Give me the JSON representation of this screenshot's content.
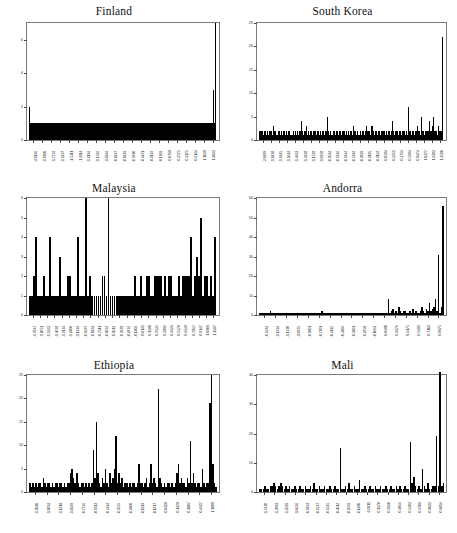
{
  "figure": {
    "title": "",
    "background": "#ffffff",
    "bar_color": "#000000",
    "axis_color": "#7a7a7a",
    "layout": "2 columns x 3 rows"
  },
  "chart_data": [
    {
      "type": "bar",
      "title": "Finland",
      "xlabel": "",
      "ylabel": "",
      "ylim": [
        0,
        7
      ],
      "yticks": [
        0,
        2,
        4,
        6
      ],
      "grid": false,
      "legend": null,
      "xticklabels": [
        "-2.0196",
        "-1.8700",
        "-1.7774",
        "-1.6237",
        "-1.5311",
        "-1.3114",
        "-1.2184",
        "-1.1746",
        "-1.0244",
        "-0.9247",
        "-0.8249",
        "-0.6990",
        "-0.4421",
        "-0.3124",
        "-0.1709",
        "0.0718",
        "0.2775",
        "0.4175",
        "0.6124",
        "1.1048",
        "1.3043"
      ],
      "values": [
        2.0,
        1.0,
        1.0,
        1.0,
        1.0,
        1.0,
        1.0,
        1.0,
        1.0,
        1.0,
        1.0,
        1.0,
        1.0,
        1.0,
        1.0,
        1.0,
        1.0,
        1.0,
        1.0,
        1.0,
        1.0,
        1.0,
        1.0,
        1.0,
        1.0,
        1.0,
        1.0,
        1.0,
        1.0,
        1.0,
        1.0,
        1.0,
        1.0,
        1.0,
        1.0,
        1.0,
        1.0,
        1.0,
        1.0,
        1.0,
        1.0,
        1.0,
        1.0,
        1.0,
        1.0,
        1.0,
        1.0,
        1.0,
        1.0,
        1.0,
        1.0,
        1.0,
        1.0,
        1.0,
        1.0,
        1.0,
        1.0,
        1.0,
        1.0,
        1.0,
        1.0,
        1.0,
        1.0,
        1.0,
        1.0,
        1.0,
        1.0,
        1.0,
        1.0,
        1.0,
        1.0,
        1.0,
        1.0,
        1.0,
        1.0,
        1.0,
        1.0,
        1.0,
        1.0,
        1.0,
        1.0,
        1.0,
        1.0,
        1.0,
        1.0,
        1.0,
        1.0,
        1.0,
        1.0,
        1.0,
        1.0,
        1.0,
        1.0,
        1.0,
        1.0,
        1.0,
        1.0,
        1.0,
        1.0,
        1.0,
        1.0,
        1.0,
        1.0,
        1.0,
        1.0,
        1.0,
        1.0,
        1.0,
        1.0,
        1.0,
        1.0,
        1.0,
        1.0,
        1.0,
        1.0,
        1.0,
        1.0,
        1.0,
        1.0,
        1.0,
        1.0,
        1.0,
        1.0,
        1.0,
        1.0,
        1.0,
        1.0,
        1.0,
        1.0,
        1.0,
        1.0,
        1.0,
        1.0,
        1.0,
        1.0,
        1.0,
        1.0,
        1.0,
        1.0,
        1.0,
        1.0,
        1.0,
        1.0,
        1.0,
        1.0,
        1.0,
        1.0,
        1.0,
        1.0,
        1.0,
        1.0,
        1.0,
        1.0,
        1.0,
        1.0,
        1.0,
        1.0,
        1.0,
        1.0,
        1.0,
        1.0,
        1.0,
        1.0,
        1.0,
        1.0,
        1.0,
        1.0,
        1.0,
        1.0,
        1.0,
        1.0,
        1.0,
        1.0,
        1.0,
        1.0,
        1.0,
        1.0,
        1.0,
        1.0,
        1.0,
        1.0,
        1.0,
        1.0,
        1.0,
        1.0,
        1.0,
        1.0,
        1.0,
        1.0,
        1.0,
        1.0,
        1.0,
        1.0,
        3.0,
        1.0,
        7.0
      ]
    },
    {
      "type": "bar",
      "title": "South Korea",
      "xlabel": "",
      "ylabel": "",
      "ylim": [
        0,
        25
      ],
      "yticks": [
        0,
        5,
        10,
        15,
        20,
        25
      ],
      "grid": false,
      "legend": null,
      "xticklabels": [
        "-2.0289",
        "-1.8438",
        "-1.6945",
        "-1.5042",
        "-1.4423",
        "-1.3228",
        "-1.1728",
        "-1.0768",
        "-0.9584",
        "-0.7246",
        "-0.6344",
        "-0.5284",
        "-0.3849",
        "-0.2185",
        "-0.1168",
        "0.0584",
        "0.2251",
        "0.3766",
        "0.5984",
        "0.8474",
        "1.0277",
        "1.2382",
        "1.3580"
      ],
      "values": [
        2,
        2,
        2,
        2,
        1,
        2,
        2,
        1,
        2,
        1,
        2,
        2,
        1,
        3,
        2,
        2,
        1,
        1,
        2,
        2,
        1,
        2,
        1,
        2,
        2,
        1,
        2,
        1,
        2,
        2,
        1,
        1,
        2,
        1,
        2,
        1,
        2,
        1,
        2,
        2,
        4,
        2,
        1,
        2,
        2,
        3,
        1,
        2,
        1,
        2,
        2,
        1,
        2,
        2,
        1,
        2,
        2,
        1,
        2,
        1,
        2,
        2,
        1,
        2,
        2,
        5,
        2,
        1,
        2,
        1,
        1,
        2,
        2,
        1,
        2,
        1,
        2,
        2,
        1,
        2,
        2,
        2,
        1,
        2,
        1,
        2,
        1,
        2,
        2,
        1,
        3,
        2,
        2,
        1,
        2,
        1,
        2,
        1,
        2,
        2,
        1,
        2,
        3,
        2,
        2,
        2,
        1,
        3,
        3,
        2,
        1,
        2,
        2,
        1,
        2,
        2,
        1,
        2,
        2,
        2,
        1,
        2,
        1,
        2,
        2,
        1,
        2,
        4,
        2,
        1,
        2,
        2,
        2,
        1,
        2,
        2,
        1,
        2,
        2,
        1,
        2,
        1,
        7,
        2,
        2,
        1,
        2,
        2,
        1,
        2,
        2,
        3,
        2,
        2,
        1,
        5,
        2,
        2,
        1,
        2,
        2,
        2,
        4,
        2,
        2,
        3,
        5,
        2,
        2,
        2,
        1,
        3,
        2,
        2,
        2,
        22
      ]
    },
    {
      "type": "bar",
      "title": "Malaysia",
      "xlabel": "",
      "ylabel": "",
      "ylim": [
        0,
        6
      ],
      "yticks": [
        0,
        1,
        2,
        3,
        4,
        5,
        6
      ],
      "grid": false,
      "legend": null,
      "xticklabels": [
        "-1.7847",
        "-1.6051",
        "-1.5363",
        "-1.4078",
        "-1.3174",
        "-1.2400",
        "-1.1249",
        "-0.9587",
        "-0.8233",
        "-0.7511",
        "-0.6052",
        "-0.5013",
        "-0.3978",
        "-0.2474",
        "-0.1306",
        "0.0132",
        "0.1580",
        "0.2545",
        "0.3886",
        "0.4624",
        "0.5578",
        "0.6548",
        "0.7867",
        "0.9147",
        "1.0909",
        "1.1587"
      ],
      "values": [
        1,
        1,
        2,
        4,
        1,
        1,
        1,
        2,
        1,
        1,
        4,
        1,
        1,
        1,
        1,
        3,
        1,
        1,
        1,
        2,
        2,
        1,
        1,
        1,
        4,
        1,
        1,
        1,
        6,
        1,
        2,
        1,
        1,
        1,
        1,
        1,
        2,
        2,
        1,
        6,
        1,
        1,
        1,
        1,
        1,
        1,
        1,
        1,
        1,
        1,
        1,
        1,
        2,
        1,
        1,
        2,
        1,
        1,
        2,
        2,
        1,
        1,
        2,
        2,
        2,
        2,
        1,
        2,
        1,
        2,
        2,
        1,
        1,
        1,
        2,
        1,
        2,
        2,
        2,
        2,
        4,
        1,
        2,
        3,
        2,
        5,
        1,
        2,
        2,
        1,
        2,
        1,
        4
      ]
    },
    {
      "type": "bar",
      "title": "Andorra",
      "xlabel": "",
      "ylabel": "",
      "ylim": [
        0,
        60
      ],
      "yticks": [
        0,
        10,
        20,
        30,
        40,
        50,
        60
      ],
      "grid": false,
      "legend": null,
      "xticklabels": [
        "-0.5684",
        "-1.1494",
        "-1.1720",
        "-1.0875",
        "-0.9801",
        "-0.7701",
        "-0.6145",
        "-0.4306",
        "-0.3401",
        "-0.2258",
        "-0.1063",
        "0.0680",
        "0.2476",
        "0.4175",
        "0.5682",
        "0.7103",
        "0.8975"
      ],
      "values": [
        1,
        1,
        1,
        1,
        1,
        1,
        1,
        2,
        1,
        1,
        1,
        1,
        1,
        1,
        1,
        1,
        1,
        1,
        1,
        1,
        1,
        1,
        1,
        1,
        1,
        1,
        1,
        1,
        1,
        1,
        1,
        1,
        1,
        1,
        1,
        1,
        1,
        1,
        1,
        1,
        1,
        2,
        1,
        1,
        1,
        1,
        1,
        1,
        1,
        1,
        1,
        1,
        1,
        1,
        1,
        1,
        1,
        1,
        1,
        1,
        1,
        1,
        1,
        1,
        1,
        1,
        1,
        1,
        1,
        1,
        1,
        1,
        1,
        1,
        1,
        1,
        1,
        1,
        1,
        1,
        1,
        1,
        1,
        1,
        1,
        8,
        1,
        2,
        3,
        1,
        2,
        1,
        4,
        2,
        1,
        2,
        2,
        1,
        1,
        2,
        1,
        3,
        1,
        2,
        1,
        1,
        2,
        4,
        2,
        1,
        3,
        2,
        6,
        2,
        3,
        4,
        8,
        2,
        31,
        1,
        4,
        56
      ]
    },
    {
      "type": "bar",
      "title": "Ethiopia",
      "xlabel": "",
      "ylabel": "",
      "ylim": [
        0,
        25
      ],
      "yticks": [
        0,
        5,
        10,
        15,
        20,
        25
      ],
      "grid": false,
      "legend": null,
      "xticklabels": [
        "-1.3040",
        "-1.0093",
        "-1.1318",
        "-1.0249",
        "-0.7736",
        "-0.5913",
        "-0.4744",
        "-0.3655",
        "-0.2400",
        "-0.1913",
        "-0.1417",
        "0.0418",
        "0.1928",
        "0.3007",
        "0.4627",
        "1.1008"
      ],
      "values": [
        2,
        1,
        2,
        1,
        2,
        1,
        2,
        2,
        1,
        3,
        2,
        1,
        2,
        2,
        1,
        2,
        1,
        2,
        2,
        1,
        2,
        2,
        1,
        2,
        1,
        2,
        2,
        4,
        5,
        3,
        2,
        4,
        2,
        1,
        2,
        2,
        1,
        2,
        1,
        2,
        1,
        2,
        9,
        3,
        15,
        4,
        2,
        1,
        3,
        2,
        5,
        2,
        1,
        4,
        2,
        3,
        5,
        12,
        2,
        4,
        2,
        3,
        1,
        2,
        2,
        1,
        2,
        1,
        2,
        2,
        1,
        2,
        6,
        2,
        2,
        1,
        2,
        3,
        1,
        2,
        6,
        2,
        3,
        2,
        1,
        22,
        3,
        2,
        1,
        2,
        1,
        2,
        2,
        1,
        2,
        1,
        2,
        4,
        6,
        2,
        3,
        2,
        2,
        1,
        3,
        2,
        11,
        2,
        4,
        2,
        1,
        2,
        2,
        1,
        5,
        2,
        1,
        2,
        2,
        19,
        25,
        6,
        2,
        1
      ]
    },
    {
      "type": "bar",
      "title": "Mali",
      "xlabel": "",
      "ylabel": "",
      "ylim": [
        0,
        40
      ],
      "yticks": [
        0,
        10,
        20,
        30,
        40
      ],
      "grid": false,
      "legend": null,
      "xticklabels": [
        "-1.6730",
        "-1.3883",
        "-1.2589",
        "-1.0636",
        "-0.9363",
        "-0.7547",
        "-0.5645",
        "-0.4012",
        "-0.2669",
        "-0.1480",
        "0.0211",
        "0.1670",
        "0.2920",
        "0.4066",
        "0.5282",
        "0.6709",
        "0.8032",
        "0.9014"
      ],
      "values": [
        1,
        1,
        1,
        2,
        1,
        1,
        2,
        2,
        3,
        2,
        1,
        2,
        3,
        2,
        1,
        2,
        1,
        2,
        1,
        1,
        2,
        1,
        1,
        2,
        1,
        1,
        2,
        1,
        1,
        2,
        1,
        3,
        1,
        1,
        2,
        1,
        1,
        2,
        1,
        1,
        2,
        1,
        1,
        2,
        1,
        1,
        15,
        1,
        1,
        2,
        1,
        3,
        1,
        1,
        2,
        1,
        1,
        4,
        1,
        1,
        2,
        1,
        1,
        2,
        1,
        1,
        2,
        1,
        1,
        2,
        1,
        1,
        2,
        1,
        1,
        2,
        1,
        1,
        2,
        1,
        2,
        1,
        1,
        2,
        1,
        1,
        17,
        3,
        5,
        2,
        1,
        2,
        1,
        8,
        2,
        1,
        3,
        1,
        1,
        2,
        2,
        19,
        2,
        41,
        2,
        3
      ]
    }
  ]
}
